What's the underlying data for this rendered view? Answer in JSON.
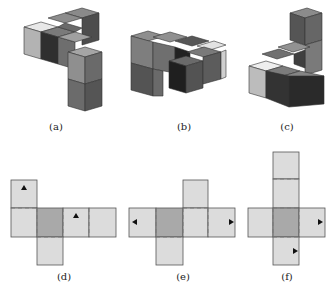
{
  "figures": {
    "a": {
      "label": "(a)"
    },
    "b": {
      "label": "(b)"
    },
    "c": {
      "label": "(c)"
    },
    "d": {
      "label": "(d)"
    },
    "e": {
      "label": "(e)"
    },
    "f": {
      "label": "(f)"
    }
  },
  "colors": {
    "net_face": "#dcdcdc",
    "net_center": "#a9a9a9",
    "net_border": "#555555",
    "cube_light": "#e6e6e6",
    "cube_mid": "#9a9a9a",
    "cube_dark": "#5a5a5a",
    "cube_darkest": "#2e2e2e"
  }
}
